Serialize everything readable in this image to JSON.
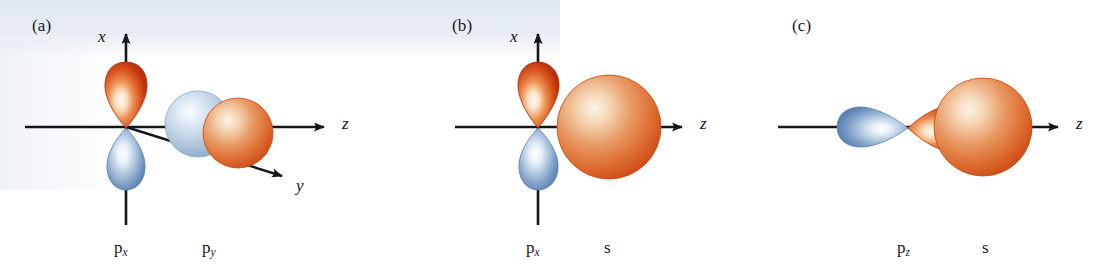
{
  "figure": {
    "kind": "orbital-overlap-diagram",
    "width": 1108,
    "height": 276,
    "background": "#ffffff"
  },
  "colors": {
    "lobe_red_edge": "#c3330f",
    "lobe_red_mid": "#e2622a",
    "lobe_red_light": "#fdf3e6",
    "lobe_blue_edge": "#5e84b5",
    "lobe_blue_mid": "#9ab6d6",
    "lobe_blue_light": "#fbfdff",
    "sphere_orange_edge": "#d4521f",
    "sphere_orange_mid": "#e5884f",
    "sphere_orange_light": "#fbe9d8",
    "sphere_blue_edge": "#8da9c6",
    "sphere_blue_mid": "#b7cade",
    "sphere_blue_light": "#f4f8fc",
    "axis": "#1a1a1a",
    "text": "#1b1b1b",
    "scan_tint": "#dee5ee"
  },
  "panels": [
    {
      "id": "a",
      "label": "(a)",
      "axes": [
        {
          "name": "x",
          "label": "x",
          "direction": "up"
        },
        {
          "name": "z",
          "label": "z",
          "direction": "right"
        },
        {
          "name": "y",
          "label": "y",
          "direction": "down-right"
        }
      ],
      "orbitals": [
        {
          "name": "p-x-orbital",
          "label": "p",
          "subscript": "x",
          "type": "p",
          "orientation": "vertical",
          "lobes": [
            "red-up",
            "blue-down"
          ]
        },
        {
          "name": "p-y-orbital",
          "label": "p",
          "subscript": "y",
          "type": "p",
          "orientation": "end-on",
          "lobes": [
            "blue-sphere",
            "orange-sphere"
          ]
        }
      ]
    },
    {
      "id": "b",
      "label": "(b)",
      "axes": [
        {
          "name": "x",
          "label": "x",
          "direction": "up"
        },
        {
          "name": "z",
          "label": "z",
          "direction": "right"
        }
      ],
      "orbitals": [
        {
          "name": "p-x-orbital",
          "label": "p",
          "subscript": "x",
          "type": "p",
          "orientation": "vertical",
          "lobes": [
            "red-up",
            "blue-down"
          ]
        },
        {
          "name": "s-orbital",
          "label": "s",
          "subscript": "",
          "type": "s",
          "orientation": "sphere",
          "lobes": [
            "orange-sphere"
          ]
        }
      ]
    },
    {
      "id": "c",
      "label": "(c)",
      "axes": [
        {
          "name": "z",
          "label": "z",
          "direction": "right"
        }
      ],
      "orbitals": [
        {
          "name": "p-z-orbital",
          "label": "p",
          "subscript": "z",
          "type": "p",
          "orientation": "horizontal",
          "lobes": [
            "blue-left",
            "red-right"
          ]
        },
        {
          "name": "s-orbital",
          "label": "s",
          "subscript": "",
          "type": "s",
          "orientation": "sphere",
          "lobes": [
            "orange-sphere"
          ]
        }
      ]
    }
  ]
}
